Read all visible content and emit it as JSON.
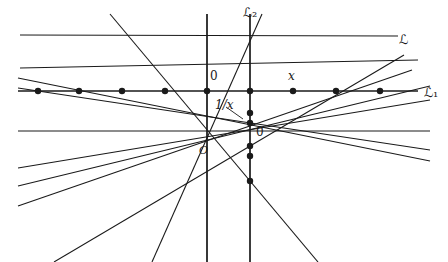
{
  "figure": {
    "width": 448,
    "height": 262,
    "background": "#ffffff",
    "ink": "#1a1a1a"
  },
  "labels": {
    "line_L1": "ℒ₁",
    "line_L2": "ℒ₂",
    "line_L": "ℒ",
    "origin": "O",
    "zero_on_L1": "0",
    "zero_on_L2": "0",
    "point_x": "x",
    "point_recip": "1/x"
  },
  "label_positions": {
    "line_L1": {
      "x": 424,
      "y": 86
    },
    "line_L2": {
      "x": 243,
      "y": 6
    },
    "line_L": {
      "x": 399,
      "y": 33
    },
    "origin": {
      "x": 199,
      "y": 145
    },
    "zero_on_L1": {
      "x": 210,
      "y": 70
    },
    "zero_on_L2": {
      "x": 256,
      "y": 126
    },
    "point_x": {
      "x": 288,
      "y": 70
    },
    "point_recip": {
      "x": 215,
      "y": 99
    }
  },
  "geometry": {
    "origin": {
      "x": 207,
      "y": 131
    },
    "axis_vertical_x": 207,
    "L1": {
      "y": 91,
      "x1": 18,
      "x2": 418
    },
    "L2": {
      "x": 250,
      "y1": 14,
      "y2": 262
    },
    "horizontal_through_origin": {
      "y": 131,
      "x1": 18,
      "x2": 430
    },
    "vertical_through_origin": {
      "x": 207,
      "y1": 14,
      "y2": 262
    }
  },
  "chart_data": {
    "type": "scatter",
    "xlabel": "",
    "ylabel": "",
    "pencil_lines": [
      {
        "name": "ray-1",
        "x1": 18,
        "y1": 88,
        "x2": 430,
        "y2": 150
      },
      {
        "name": "ray-2",
        "x1": 18,
        "y1": 78,
        "x2": 430,
        "y2": 161
      },
      {
        "name": "ray-3",
        "x1": 20,
        "y1": 68,
        "x2": 418,
        "y2": 60
      },
      {
        "name": "ray-4",
        "x1": 20,
        "y1": 35,
        "x2": 398,
        "y2": 36
      },
      {
        "name": "ray-5",
        "x1": 110,
        "y1": 14,
        "x2": 318,
        "y2": 262
      },
      {
        "name": "ray-6",
        "x1": 207,
        "y1": 14,
        "x2": 207,
        "y2": 262
      },
      {
        "name": "ray-7",
        "x1": 262,
        "y1": 14,
        "x2": 152,
        "y2": 262
      },
      {
        "name": "ray-8",
        "x1": 18,
        "y1": 131,
        "x2": 430,
        "y2": 131
      },
      {
        "name": "ray-9",
        "x1": 18,
        "y1": 186,
        "x2": 430,
        "y2": 86
      },
      {
        "name": "ray-10",
        "x1": 18,
        "y1": 206,
        "x2": 412,
        "y2": 70
      },
      {
        "name": "ray-11",
        "x1": 54,
        "y1": 262,
        "x2": 404,
        "y2": 55
      },
      {
        "name": "ray-12",
        "x1": 18,
        "y1": 168,
        "x2": 430,
        "y2": 100
      }
    ],
    "dots_on_L1": [
      {
        "label": "",
        "x": 38,
        "y": 91
      },
      {
        "label": "",
        "x": 79,
        "y": 91
      },
      {
        "label": "",
        "x": 122,
        "y": 91
      },
      {
        "label": "",
        "x": 165,
        "y": 91
      },
      {
        "label": "0",
        "x": 207,
        "y": 91
      },
      {
        "label": "",
        "x": 250,
        "y": 91
      },
      {
        "label": "x",
        "x": 293,
        "y": 91
      },
      {
        "label": "",
        "x": 336,
        "y": 91
      },
      {
        "label": "",
        "x": 380,
        "y": 91
      }
    ],
    "dots_on_L2": [
      {
        "label": "1/x",
        "x": 250,
        "y": 113
      },
      {
        "label": "",
        "x": 250,
        "y": 123
      },
      {
        "label": "",
        "x": 250,
        "y": 146
      },
      {
        "label": "",
        "x": 250,
        "y": 156
      },
      {
        "label": "",
        "x": 250,
        "y": 181
      }
    ]
  }
}
